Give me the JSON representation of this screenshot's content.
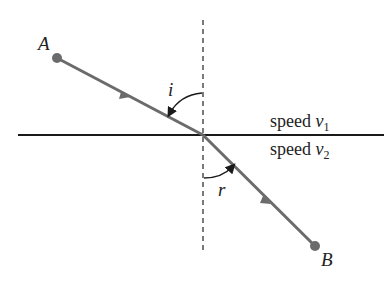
{
  "diagram": {
    "type": "refraction",
    "points": {
      "A": {
        "label": "A",
        "x": 57,
        "y": 58
      },
      "O": {
        "x": 203,
        "y": 135
      },
      "B": {
        "label": "B",
        "x": 315,
        "y": 246
      }
    },
    "angles": {
      "incidence": "i",
      "refraction": "r"
    },
    "media": {
      "upper": {
        "label": "speed ",
        "var": "v",
        "sub": "1"
      },
      "lower": {
        "label": "speed ",
        "var": "v",
        "sub": "2"
      }
    },
    "colors": {
      "ray": "#6b6b6b",
      "interface": "#1a1a1a",
      "normal": "#333333",
      "text": "#222222"
    }
  }
}
